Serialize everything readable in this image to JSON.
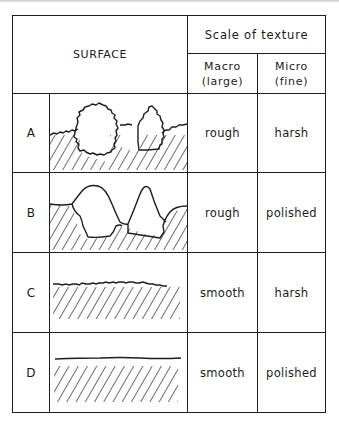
{
  "header": {
    "surface_label": "SURFACE",
    "scale_label": "Scale of texture",
    "macro_label_line1": "Macro",
    "macro_label_line2": "(large)",
    "micro_label_line1": "Micro",
    "micro_label_line2": "(fine)"
  },
  "rows": [
    {
      "id": "A",
      "macro": "rough",
      "micro": "harsh",
      "drawing": "large-rough-protrusions-with-jagged-outline"
    },
    {
      "id": "B",
      "macro": "rough",
      "micro": "polished",
      "drawing": "large-rough-protrusions-with-smooth-outline"
    },
    {
      "id": "C",
      "macro": "smooth",
      "micro": "harsh",
      "drawing": "flat-surface-with-jagged-line"
    },
    {
      "id": "D",
      "macro": "smooth",
      "micro": "polished",
      "drawing": "flat-surface-with-smooth-line"
    }
  ],
  "colors": {
    "line": "#1e1e1e",
    "background": "#ffffff"
  }
}
